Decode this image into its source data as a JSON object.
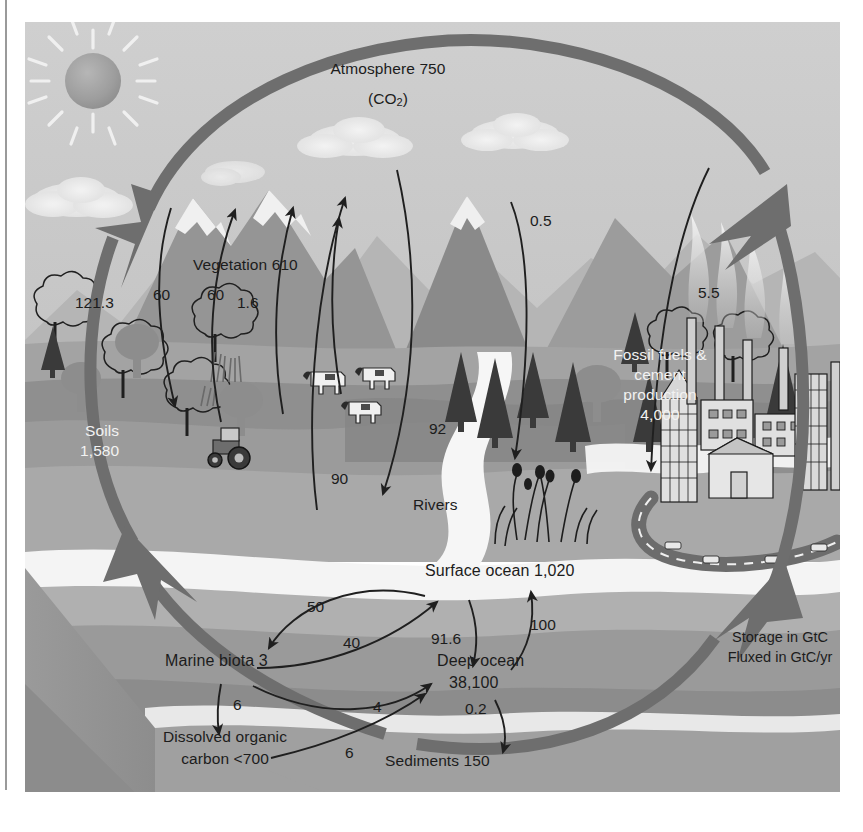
{
  "diagram": {
    "domain": "Diagram",
    "style": "grayscale textbook illustration, 3-D block landscape with circular cycle arrow"
  },
  "legend": {
    "line1": "Storage in GtC",
    "line2": "Fluxed in GtC/yr"
  },
  "reservoirs": [
    {
      "key": "atmosphere",
      "label": "Atmosphere 750",
      "value": 750,
      "unit": "GtC",
      "sublabel": "(CO2)"
    },
    {
      "key": "vegetation",
      "label": "Vegetation 610",
      "value": 610,
      "unit": "GtC"
    },
    {
      "key": "soils",
      "label": "Soils\n1,580",
      "value": 1580,
      "unit": "GtC"
    },
    {
      "key": "fossil",
      "label": "Fossil fuels &\ncement\nproduction\n4,000",
      "value": 4000,
      "unit": "GtC"
    },
    {
      "key": "surface_ocean",
      "label": "Surface ocean 1,020",
      "value": 1020,
      "unit": "GtC"
    },
    {
      "key": "deep_ocean",
      "label": "Deep ocean\n38,100",
      "value": 38100,
      "unit": "GtC"
    },
    {
      "key": "marine_biota",
      "label": "Marine biota 3",
      "value": 3,
      "unit": "GtC"
    },
    {
      "key": "doc",
      "label": "Dissolved organic\ncarbon <700",
      "value": 700,
      "unit": "GtC"
    },
    {
      "key": "sediments",
      "label": "Sediments 150",
      "value": 150,
      "unit": "GtC"
    },
    {
      "key": "rivers",
      "label": "Rivers",
      "value": null,
      "unit": ""
    }
  ],
  "labels": {
    "atmosphere": "Atmosphere 750",
    "co2_pre": "(CO",
    "co2_sub": "2",
    "co2_post": ")",
    "vegetation": "Vegetation 610",
    "soils_l1": "Soils",
    "soils_l2": "1,580",
    "fossil_l1": "Fossil fuels &",
    "fossil_l2": "cement",
    "fossil_l3": "production",
    "fossil_l4": "4,000",
    "rivers": "Rivers",
    "surface_ocean": "Surface ocean 1,020",
    "deep_ocean_l1": "Deep ocean",
    "deep_ocean_l2": "38,100",
    "marine_biota": "Marine biota 3",
    "doc_l1": "Dissolved organic",
    "doc_l2": "carbon <700",
    "sediments": "Sediments 150"
  },
  "fluxes": [
    {
      "key": "photosynthesis",
      "value": "121.3",
      "from": "atmosphere",
      "to": "vegetation",
      "direction": "down"
    },
    {
      "key": "plant_respiration",
      "value": "60",
      "from": "vegetation",
      "to": "atmosphere",
      "direction": "up"
    },
    {
      "key": "soil_respiration",
      "value": "60",
      "from": "soils",
      "to": "atmosphere",
      "direction": "up"
    },
    {
      "key": "land_use_change",
      "value": "1.6",
      "from": "vegetation",
      "to": "atmosphere",
      "direction": "up"
    },
    {
      "key": "ocean_to_atm",
      "value": "90",
      "from": "surface_ocean",
      "to": "atmosphere",
      "direction": "up"
    },
    {
      "key": "atm_to_ocean",
      "value": "92",
      "from": "atmosphere",
      "to": "surface_ocean",
      "direction": "down"
    },
    {
      "key": "volcanism",
      "value": "0.5",
      "from": "atmosphere",
      "to": "land",
      "direction": "down"
    },
    {
      "key": "fossil_emissions",
      "value": "5.5",
      "from": "fossil",
      "to": "atmosphere",
      "direction": "up"
    },
    {
      "key": "surface_to_biota",
      "value": "50",
      "from": "surface_ocean",
      "to": "marine_biota",
      "direction": "down"
    },
    {
      "key": "biota_to_surface",
      "value": "40",
      "from": "marine_biota",
      "to": "surface_ocean",
      "direction": "up"
    },
    {
      "key": "deep_to_surface",
      "value": "100",
      "from": "deep_ocean",
      "to": "surface_ocean",
      "direction": "up"
    },
    {
      "key": "surface_to_deep",
      "value": "91.6",
      "from": "surface_ocean",
      "to": "deep_ocean",
      "direction": "down"
    },
    {
      "key": "biota_to_deep",
      "value": "4",
      "from": "marine_biota",
      "to": "deep_ocean",
      "direction": "right"
    },
    {
      "key": "biota_to_doc",
      "value": "6",
      "from": "marine_biota",
      "to": "doc",
      "direction": "down"
    },
    {
      "key": "doc_to_deep",
      "value": "6",
      "from": "doc",
      "to": "deep_ocean",
      "direction": "right"
    },
    {
      "key": "deep_to_sediments",
      "value": "0.2",
      "from": "deep_ocean",
      "to": "sediments",
      "direction": "down"
    }
  ],
  "scene_elements": [
    "sun",
    "clouds",
    "snow-capped-mountains",
    "volcano",
    "forest-trees",
    "conifers",
    "grazing-cows",
    "tractor",
    "river",
    "marsh-plants",
    "industrial-city",
    "smokestacks",
    "highway-loop",
    "ocean-block"
  ],
  "colors": {
    "sky": "#c8c8c8",
    "mid_gray": "#a8a8a8",
    "dark_gray": "#8b8b8b",
    "darker_gray": "#7a7a7a",
    "light_band": "#d6d6d6",
    "white_band": "#f4f4f4",
    "cycle_arrow": "#6e6e6e",
    "ink": "#1c1c1c",
    "light_text": "#f2f2f2"
  }
}
